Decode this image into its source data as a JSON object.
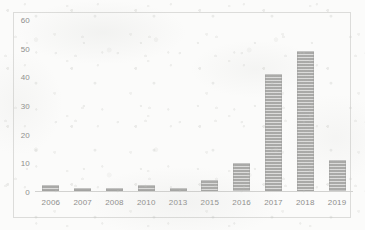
{
  "chart_data": {
    "type": "bar",
    "title": "",
    "xlabel": "",
    "ylabel": "",
    "categories": [
      "2006",
      "2007",
      "2008",
      "2010",
      "2013",
      "2015",
      "2016",
      "2017",
      "2018",
      "2019"
    ],
    "values": [
      2,
      1,
      1,
      2,
      1,
      4,
      10,
      41,
      49,
      11
    ],
    "ylim": [
      0,
      60
    ],
    "yticks": [
      "0",
      "10",
      "20",
      "30",
      "40",
      "50",
      "60"
    ],
    "ytick_values": [
      0,
      10,
      20,
      30,
      40,
      50,
      60
    ],
    "grid": false,
    "legend": null,
    "series": [
      {
        "name": "",
        "values": [
          2,
          1,
          1,
          2,
          1,
          4,
          10,
          41,
          49,
          11
        ]
      }
    ],
    "bar_color": "#a8a8a6",
    "axis_color": "#d2d2d0",
    "tick_label_color": "#8e8e8c",
    "frame_color": "#dcdcda",
    "background_color": "#fbfbfa"
  }
}
